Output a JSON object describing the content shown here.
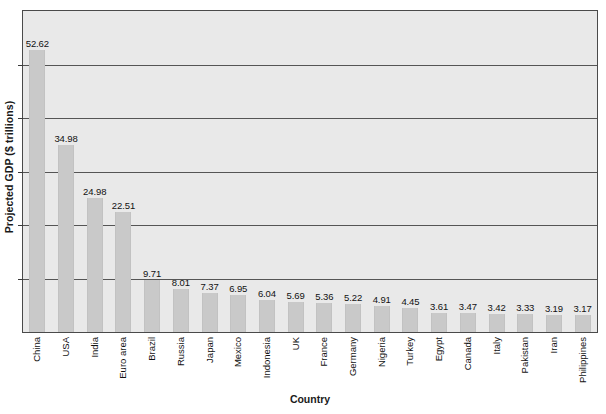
{
  "chart_data": {
    "type": "bar",
    "title": "",
    "xlabel": "Country",
    "ylabel": "Projected GDP ($ trillions)",
    "categories": [
      "China",
      "USA",
      "India",
      "Euro area",
      "Brazil",
      "Russia",
      "Japan",
      "Mexico",
      "Indonesia",
      "UK",
      "France",
      "Germany",
      "Nigeria",
      "Turkey",
      "Egypt",
      "Canada",
      "Italy",
      "Pakistan",
      "Iran",
      "Philippines"
    ],
    "values": [
      52.62,
      34.98,
      24.98,
      22.51,
      9.71,
      8.01,
      7.37,
      6.95,
      6.04,
      5.69,
      5.36,
      5.22,
      4.91,
      4.45,
      3.61,
      3.47,
      3.42,
      3.33,
      3.19,
      3.17
    ],
    "value_labels": [
      "52.62",
      "34.98",
      "24.98",
      "22.51",
      "9.71",
      "8.01",
      "7.37",
      "6.95",
      "6.04",
      "5.69",
      "5.36",
      "5.22",
      "4.91",
      "4.45",
      "3.61",
      "3.47",
      "3.42",
      "3.33",
      "3.19",
      "3.17"
    ],
    "ylim": [
      0,
      60
    ],
    "ytick_interval": 10,
    "ytick_labels_visible": false,
    "grid": true,
    "legend": false,
    "bar_color": "#c9c9c9",
    "plot_background": "#e9e9e9",
    "axis_color": "#4a4a4a",
    "gridline_color": "#555555",
    "text_color": "#111111"
  }
}
